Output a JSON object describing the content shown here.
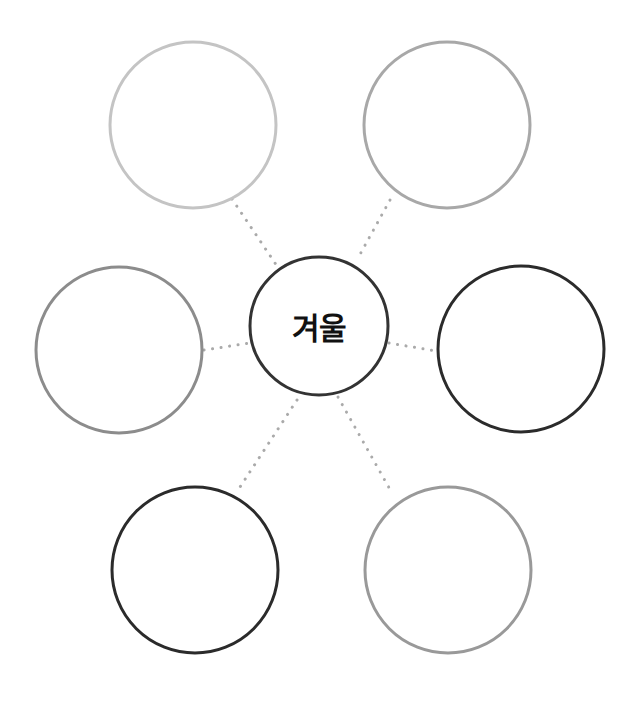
{
  "diagram": {
    "type": "mind-map",
    "center": {
      "label": "겨울",
      "cx": 319,
      "cy": 326,
      "r": 69,
      "stroke": "#333333"
    },
    "nodes": [
      {
        "id": "top-left",
        "label": "",
        "cx": 193,
        "cy": 125,
        "r": 83,
        "stroke": "#c4c4c4"
      },
      {
        "id": "top-right",
        "label": "",
        "cx": 447,
        "cy": 125,
        "r": 83,
        "stroke": "#a8a8a8"
      },
      {
        "id": "middle-left",
        "label": "",
        "cx": 119,
        "cy": 350,
        "r": 83,
        "stroke": "#8c8c8c"
      },
      {
        "id": "middle-right",
        "label": "",
        "cx": 521,
        "cy": 349,
        "r": 83,
        "stroke": "#2b2b2b"
      },
      {
        "id": "bottom-left",
        "label": "",
        "cx": 195,
        "cy": 570,
        "r": 83,
        "stroke": "#2b2b2b"
      },
      {
        "id": "bottom-right",
        "label": "",
        "cx": 448,
        "cy": 570,
        "r": 83,
        "stroke": "#999999"
      }
    ],
    "connector_color": "#aaaaaa"
  }
}
